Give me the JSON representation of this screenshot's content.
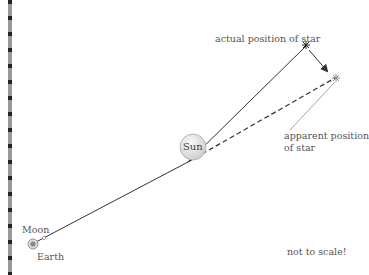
{
  "diagram": {
    "labels": {
      "actual_star": "actual position of star",
      "apparent_star_line1": "apparent position",
      "apparent_star_line2": "of star",
      "sun": "Sun",
      "moon": "Moon",
      "earth": "Earth",
      "scale_note": "not to scale!"
    },
    "colors": {
      "line": "#333333",
      "dashed": "#333333",
      "sun_fill": "#e6e6e6",
      "text": "#555555"
    }
  }
}
